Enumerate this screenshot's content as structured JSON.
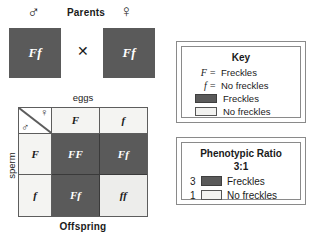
{
  "diagram": {
    "colors": {
      "dominant_fill": "#5a5a5a",
      "recessive_fill": "#ededeb",
      "header_fill": "#f4f4f2",
      "line": "#5d5d5d",
      "text": "#1a1a1a"
    }
  },
  "parents": {
    "heading": "Parents",
    "male_symbol": "♂",
    "female_symbol": "♀",
    "male_genotype": "Ff",
    "female_genotype": "Ff",
    "cross_symbol": "✕"
  },
  "punnett": {
    "top_axis_label": "eggs",
    "side_axis_label": "sperm",
    "bottom_label": "Offspring",
    "corner_female_symbol": "♀",
    "corner_male_symbol": "♂",
    "column_headers": [
      "F",
      "f"
    ],
    "row_headers": [
      "F",
      "f"
    ],
    "cells": [
      [
        {
          "genotype": "FF",
          "phenotype": "Freckles",
          "fill": "dominant"
        },
        {
          "genotype": "Ff",
          "phenotype": "Freckles",
          "fill": "dominant"
        }
      ],
      [
        {
          "genotype": "Ff",
          "phenotype": "Freckles",
          "fill": "dominant"
        },
        {
          "genotype": "ff",
          "phenotype": "No freckles",
          "fill": "recessive"
        }
      ]
    ]
  },
  "key": {
    "title": "Key",
    "rows": [
      {
        "symbol": "F",
        "equals": "=",
        "label": "Freckles"
      },
      {
        "symbol": "f",
        "equals": "=",
        "label": "No freckles"
      }
    ],
    "swatches": [
      {
        "swatch": "dominant",
        "label": "Freckles"
      },
      {
        "swatch": "recessive",
        "label": "No freckles"
      }
    ]
  },
  "ratio": {
    "title": "Phenotypic Ratio",
    "value": "3:1",
    "rows": [
      {
        "count": "3",
        "swatch": "dominant",
        "label": "Freckles"
      },
      {
        "count": "1",
        "swatch": "recessive",
        "label": "No freckles"
      }
    ]
  }
}
